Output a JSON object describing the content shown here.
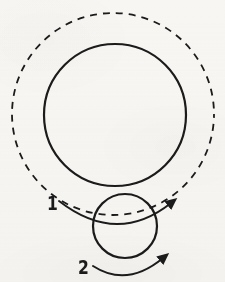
{
  "figure": {
    "background_color": "#f7f6f3",
    "stroke_color": "#1b1b1b",
    "width": 225,
    "height": 282
  },
  "shapes": {
    "outer_dashed_circle": {
      "name": "outer-dashed-circle",
      "style": "dashed",
      "center_x": 113,
      "center_y": 114,
      "radius": 101,
      "stroke_width": 1.8,
      "dash_pattern": "7 6"
    },
    "large_solid_circle": {
      "name": "large-solid-circle",
      "style": "solid",
      "center_x": 115,
      "center_y": 115,
      "radius": 71,
      "stroke_width": 2.2
    },
    "small_solid_circle": {
      "name": "small-solid-circle",
      "style": "solid",
      "center_x": 125,
      "center_y": 226,
      "radius": 32,
      "stroke_width": 2.2
    }
  },
  "arrows": [
    {
      "id": "arrow-1",
      "label": "1",
      "label_x": 52,
      "label_y": 203,
      "direction": "clockwise-right",
      "arrowhead": "filled-triangle",
      "arrowhead_x": 174,
      "arrowhead_y": 203,
      "start_x": 59,
      "start_y": 201,
      "control_x": 117,
      "control_y": 246
    },
    {
      "id": "arrow-2",
      "label": "2",
      "label_x": 83,
      "label_y": 267,
      "direction": "clockwise-right",
      "arrowhead": "filled-triangle",
      "arrowhead_x": 166,
      "arrowhead_y": 258,
      "start_x": 93,
      "start_y": 266,
      "control_x": 127,
      "control_y": 288
    }
  ],
  "labels": {
    "one": "1",
    "two": "2"
  }
}
